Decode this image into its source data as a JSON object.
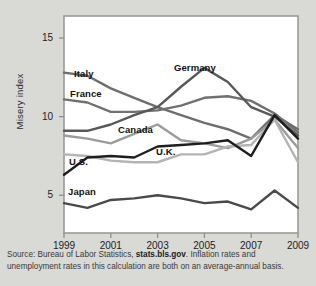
{
  "chart_data": {
    "type": "line",
    "title": "",
    "xlabel": "",
    "ylabel": "Misery index",
    "x": [
      1999,
      2000,
      2001,
      2002,
      2003,
      2004,
      2005,
      2006,
      2007,
      2008,
      2009
    ],
    "xlim": [
      1999,
      2009
    ],
    "ylim": [
      2.6,
      16.4
    ],
    "yticks": [
      5,
      10,
      15
    ],
    "ytick_labels": [
      "5",
      "10",
      "15"
    ],
    "xticks": [
      1999,
      2001,
      2003,
      2005,
      2007,
      2009
    ],
    "xtick_labels": [
      "1999",
      "2001",
      "2003",
      "2005",
      "2007",
      "2009"
    ],
    "grid": false,
    "legend_position": "inline-labels",
    "series": [
      {
        "name": "Italy",
        "color": "#6e6e6e",
        "values": [
          12.8,
          12.6,
          11.8,
          11.2,
          10.6,
          10.1,
          9.6,
          9.2,
          8.6,
          10.1,
          9.2
        ]
      },
      {
        "name": "France",
        "color": "#707070",
        "values": [
          11.1,
          10.9,
          10.3,
          10.3,
          10.4,
          10.7,
          11.2,
          11.3,
          11.0,
          10.2,
          9.0
        ]
      },
      {
        "name": "Germany",
        "color": "#585858",
        "values": [
          9.1,
          9.1,
          9.5,
          10.1,
          10.6,
          11.9,
          13.1,
          12.2,
          10.6,
          10.0,
          8.8
        ]
      },
      {
        "name": "Canada",
        "color": "#9b9b9b",
        "values": [
          8.8,
          8.6,
          8.3,
          8.9,
          9.5,
          8.5,
          8.3,
          8.0,
          8.6,
          9.8,
          8.0
        ]
      },
      {
        "name": "U.K.",
        "color": "#b4b4b4",
        "values": [
          7.6,
          7.5,
          7.2,
          7.1,
          7.1,
          7.6,
          7.6,
          8.1,
          8.2,
          9.8,
          7.1
        ]
      },
      {
        "name": "U.S.",
        "color": "#1e1e1e",
        "values": [
          6.3,
          7.4,
          7.5,
          7.4,
          8.1,
          8.2,
          8.3,
          8.5,
          7.5,
          10.1,
          8.6
        ]
      },
      {
        "name": "Japan",
        "color": "#4a4a4a",
        "values": [
          4.5,
          4.2,
          4.7,
          4.8,
          5.0,
          4.8,
          4.5,
          4.6,
          4.1,
          5.3,
          4.2
        ]
      }
    ],
    "annotations": [
      {
        "text": "Italy",
        "x_px": 74,
        "y_px": 68
      },
      {
        "text": "France",
        "x_px": 70,
        "y_px": 88
      },
      {
        "text": "Germany",
        "x_px": 174,
        "y_px": 62
      },
      {
        "text": "Canada",
        "x_px": 118,
        "y_px": 124
      },
      {
        "text": "U.K.",
        "x_px": 156,
        "y_px": 146
      },
      {
        "text": "U.S.",
        "x_px": 69,
        "y_px": 156
      },
      {
        "text": "Japan",
        "x_px": 68,
        "y_px": 186
      }
    ]
  },
  "source": {
    "line1_prefix": "Source: Bureau of Labor Statistics, ",
    "line1_link": "stats.bls.gov",
    "line1_suffix": ". Inflation rates and",
    "line2": "unemployment rates in this calculation are both on an average-annual basis."
  }
}
